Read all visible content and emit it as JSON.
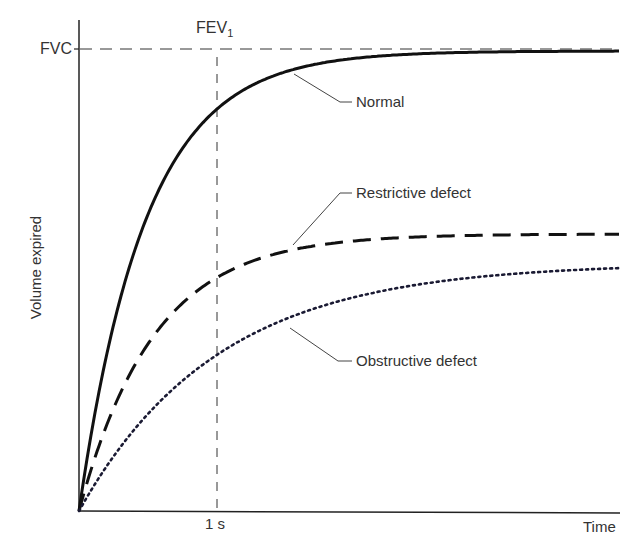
{
  "chart_data": {
    "type": "line",
    "title": "",
    "xlabel": "Time",
    "ylabel": "Volume expired",
    "x_ticks": [
      "1 s"
    ],
    "y_ticks": [
      "FVC"
    ],
    "reference_lines": {
      "horizontal": "FVC",
      "vertical": "FEV1 at 1 s"
    },
    "series": [
      {
        "name": "Normal",
        "style": "solid",
        "plateau_fraction_of_fvc": 1.0,
        "fraction_at_1s": 0.87
      },
      {
        "name": "Restrictive defect",
        "style": "dashed",
        "plateau_fraction_of_fvc": 0.6,
        "fraction_at_1s": 0.51
      },
      {
        "name": "Obstructive defect",
        "style": "dotted",
        "plateau_fraction_of_fvc": 0.53,
        "fraction_at_1s": 0.33
      }
    ],
    "grid": false,
    "legend": "inline leader labels"
  },
  "labels": {
    "fvc": "FVC",
    "fev": "FEV",
    "fev_sub": "1",
    "normal": "Normal",
    "restrictive": "Restrictive defect",
    "obstructive": "Obstructive defect",
    "xtick": "1 s",
    "xlabel": "Time",
    "ylabel": "Volume expired"
  }
}
